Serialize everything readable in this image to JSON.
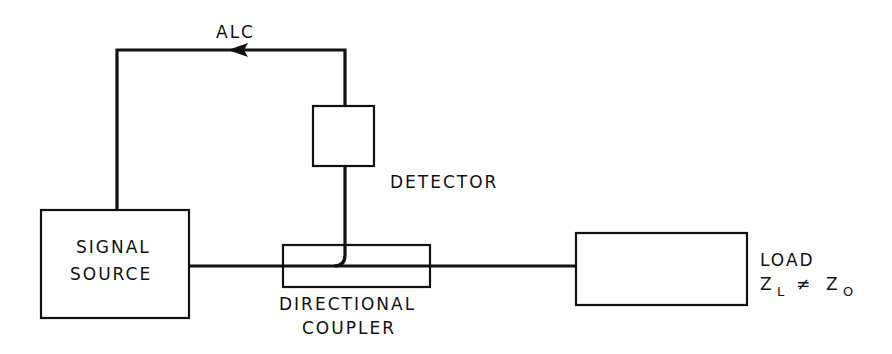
{
  "diagram": {
    "feedback_label": "ALC",
    "blocks": {
      "signal_source": {
        "line1": "SIGNAL",
        "line2": "SOURCE"
      },
      "detector": {
        "label": "DETECTOR"
      },
      "directional_coupler": {
        "line1": "DIRECTIONAL",
        "line2": "COUPLER"
      },
      "load": {
        "line1": "LOAD",
        "z_left": "Z",
        "z_left_sub": "L",
        "neq": "≠",
        "z_right": "Z",
        "z_right_sub": "O"
      }
    },
    "colors": {
      "ink": "#111111",
      "background": "#ffffff"
    }
  }
}
